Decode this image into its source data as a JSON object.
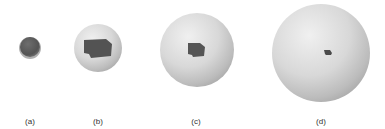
{
  "figure": {
    "panels": [
      {
        "label": "(a)",
        "sphere_shade": "dark",
        "patch": "full"
      },
      {
        "label": "(b)",
        "sphere_shade": "light",
        "patch": "large"
      },
      {
        "label": "(c)",
        "sphere_shade": "light",
        "patch": "medium"
      },
      {
        "label": "(d)",
        "sphere_shade": "light",
        "patch": "small"
      }
    ],
    "colors": {
      "background": "#ffffff",
      "sphere_light": "#e2e2e2",
      "sphere_mid": "#bdbdbd",
      "sphere_dark": "#8a8a8a",
      "patch": "#4f4f4f",
      "label": "#333333"
    }
  }
}
